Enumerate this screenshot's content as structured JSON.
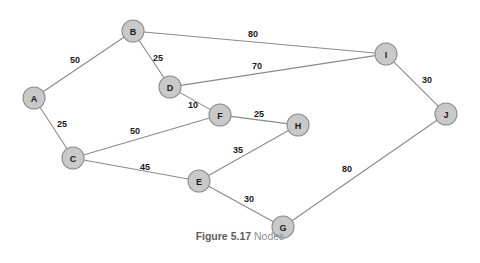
{
  "figure": {
    "caption_number": "Figure 5.17",
    "caption_text": "Nodes",
    "colors": {
      "node_fill": "#c9c9c9",
      "node_stroke": "#8e8e8e",
      "edge_stroke": "#8a8a8a",
      "label_text": "#1a1a1a",
      "caption_number": "#5d5d5d",
      "caption_text": "#8e8e8e",
      "background": "#ffffff"
    }
  },
  "chart_data": {
    "type": "graph",
    "node_radius": 11,
    "nodes": [
      {
        "id": "A",
        "label": "A",
        "x": 34,
        "y": 98
      },
      {
        "id": "B",
        "label": "B",
        "x": 133,
        "y": 31
      },
      {
        "id": "C",
        "label": "C",
        "x": 73,
        "y": 158
      },
      {
        "id": "D",
        "label": "D",
        "x": 170,
        "y": 87
      },
      {
        "id": "E",
        "label": "E",
        "x": 199,
        "y": 181
      },
      {
        "id": "F",
        "label": "F",
        "x": 220,
        "y": 115
      },
      {
        "id": "G",
        "label": "G",
        "x": 283,
        "y": 227
      },
      {
        "id": "H",
        "label": "H",
        "x": 298,
        "y": 125
      },
      {
        "id": "I",
        "label": "I",
        "x": 386,
        "y": 54
      },
      {
        "id": "J",
        "label": "J",
        "x": 446,
        "y": 114
      }
    ],
    "edges": [
      {
        "from": "A",
        "to": "B",
        "weight": 50,
        "label": "50",
        "lx": 75,
        "ly": 60
      },
      {
        "from": "A",
        "to": "C",
        "weight": 25,
        "label": "25",
        "lx": 62,
        "ly": 124
      },
      {
        "from": "B",
        "to": "D",
        "weight": 25,
        "label": "25",
        "lx": 158,
        "ly": 58
      },
      {
        "from": "B",
        "to": "I",
        "weight": 80,
        "label": "80",
        "lx": 253,
        "ly": 34
      },
      {
        "from": "D",
        "to": "I",
        "weight": 70,
        "label": "70",
        "lx": 257,
        "ly": 66
      },
      {
        "from": "D",
        "to": "F",
        "weight": 10,
        "label": "10",
        "lx": 193,
        "ly": 105
      },
      {
        "from": "C",
        "to": "F",
        "weight": 50,
        "label": "50",
        "lx": 135,
        "ly": 131
      },
      {
        "from": "C",
        "to": "E",
        "weight": 45,
        "label": "45",
        "lx": 145,
        "ly": 167
      },
      {
        "from": "F",
        "to": "H",
        "weight": 25,
        "label": "25",
        "lx": 259,
        "ly": 114
      },
      {
        "from": "E",
        "to": "H",
        "weight": 35,
        "label": "35",
        "lx": 238,
        "ly": 150
      },
      {
        "from": "E",
        "to": "G",
        "weight": 30,
        "label": "30",
        "lx": 249,
        "ly": 199
      },
      {
        "from": "G",
        "to": "J",
        "weight": 80,
        "label": "80",
        "lx": 347,
        "ly": 169
      },
      {
        "from": "I",
        "to": "J",
        "weight": 30,
        "label": "30",
        "lx": 427,
        "ly": 80
      }
    ]
  }
}
